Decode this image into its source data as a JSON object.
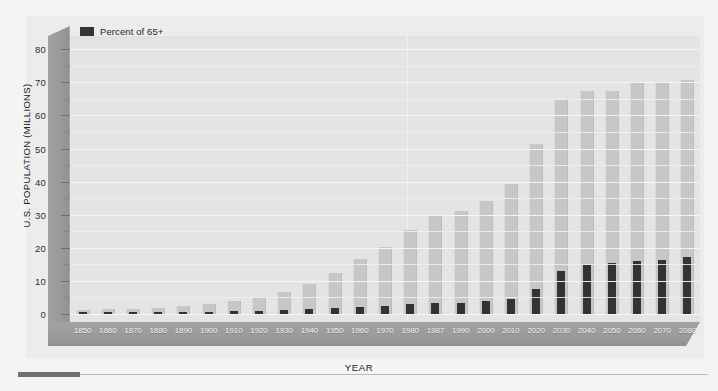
{
  "chart_data": {
    "type": "bar",
    "title": "",
    "xlabel": "YEAR",
    "ylabel": "U.S. POPULATION (MILLIONS)",
    "ylim": [
      0,
      84
    ],
    "ytick_values": [
      0,
      10,
      20,
      30,
      40,
      50,
      60,
      70,
      80
    ],
    "ytick_labels": [
      "0",
      "10",
      "20",
      "30",
      "40",
      "50",
      "60",
      "70",
      "80"
    ],
    "minor_tick_step": 5,
    "grid": true,
    "legend_position": "top-left",
    "categories": [
      "1850",
      "1860",
      "1870",
      "1880",
      "1890",
      "1900",
      "1910",
      "1920",
      "1930",
      "1940",
      "1950",
      "1960",
      "1970",
      "1980",
      "1987",
      "1990",
      "2000",
      "2010",
      "2020",
      "2030",
      "2040",
      "2050",
      "2060",
      "2070",
      "2080"
    ],
    "series": [
      {
        "name": "65+ population",
        "color": "#c7c7c5",
        "values": [
          1.3,
          1.5,
          1.4,
          1.7,
          2.4,
          3.1,
          4.0,
          4.9,
          6.7,
          9.0,
          12.3,
          16.6,
          20.1,
          25.5,
          29.8,
          31.1,
          34.0,
          39.2,
          51.4,
          64.6,
          67.4,
          67.4,
          69.8,
          69.8,
          70.8
        ]
      },
      {
        "name": "Percent of 65+",
        "color": "#333335",
        "values": [
          0.3,
          0.3,
          0.3,
          0.4,
          0.5,
          0.6,
          0.8,
          0.9,
          1.1,
          1.4,
          1.7,
          2.1,
          2.4,
          2.9,
          3.2,
          3.3,
          3.9,
          4.6,
          7.5,
          13.0,
          14.8,
          15.3,
          16.0,
          16.2,
          17.1
        ]
      }
    ],
    "legend": [
      {
        "label": "Percent of 65+",
        "swatch": "#333335"
      }
    ]
  },
  "axes": {
    "y_title": "U.S. POPULATION (MILLIONS)",
    "x_title": "YEAR"
  },
  "colors": {
    "background": "#f4f4f2",
    "plot_background": "#e4e4e2",
    "axis_band": "#9a9a9a",
    "bar_total": "#c7c7c5",
    "bar_percent": "#333335",
    "gridline": "#f7f7f6",
    "rule_accent": "#6f7175"
  }
}
